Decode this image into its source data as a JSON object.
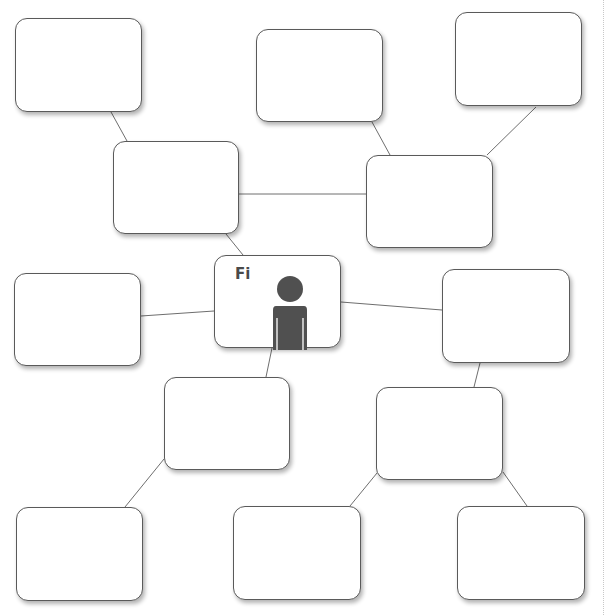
{
  "page": {
    "top_text_clipped": "",
    "background": "#ffffff"
  },
  "diagram": {
    "type": "mind-map",
    "stroke_color": "#5a5a5a",
    "line_color": "#6e6e6e",
    "center": {
      "label": "Fi",
      "icon": "person-icon",
      "icon_color": "#505050",
      "box": {
        "x": 214,
        "y": 255,
        "w": 127,
        "h": 93
      }
    },
    "nodes": [
      {
        "id": "n1",
        "text": "",
        "box": {
          "x": 15,
          "y": 18,
          "w": 127,
          "h": 94
        }
      },
      {
        "id": "n2",
        "text": "",
        "box": {
          "x": 113,
          "y": 141,
          "w": 126,
          "h": 93
        }
      },
      {
        "id": "n3",
        "text": "",
        "box": {
          "x": 256,
          "y": 29,
          "w": 127,
          "h": 93
        }
      },
      {
        "id": "n4",
        "text": "",
        "box": {
          "x": 455,
          "y": 12,
          "w": 127,
          "h": 94
        }
      },
      {
        "id": "n5",
        "text": "",
        "box": {
          "x": 366,
          "y": 155,
          "w": 127,
          "h": 93
        }
      },
      {
        "id": "n6",
        "text": "",
        "box": {
          "x": 14,
          "y": 273,
          "w": 127,
          "h": 93
        }
      },
      {
        "id": "n7",
        "text": "",
        "box": {
          "x": 442,
          "y": 269,
          "w": 128,
          "h": 94
        }
      },
      {
        "id": "n8",
        "text": "",
        "box": {
          "x": 164,
          "y": 377,
          "w": 126,
          "h": 93
        }
      },
      {
        "id": "n9",
        "text": "",
        "box": {
          "x": 376,
          "y": 387,
          "w": 127,
          "h": 93
        }
      },
      {
        "id": "n10",
        "text": "",
        "box": {
          "x": 16,
          "y": 507,
          "w": 127,
          "h": 94
        }
      },
      {
        "id": "n11",
        "text": "",
        "box": {
          "x": 233,
          "y": 506,
          "w": 128,
          "h": 94
        }
      },
      {
        "id": "n12",
        "text": "",
        "box": {
          "x": 457,
          "y": 506,
          "w": 128,
          "h": 94
        }
      }
    ],
    "links": [
      {
        "from": "n1",
        "to": "n2",
        "x1": 111,
        "y1": 112,
        "x2": 127,
        "y2": 141
      },
      {
        "from": "n2",
        "to": "n5",
        "x1": 239,
        "y1": 194,
        "x2": 366,
        "y2": 194
      },
      {
        "from": "n2",
        "to": "center",
        "x1": 226,
        "y1": 234,
        "x2": 243,
        "y2": 255
      },
      {
        "from": "n3",
        "to": "n5",
        "x1": 372,
        "y1": 122,
        "x2": 390,
        "y2": 155
      },
      {
        "from": "n4",
        "to": "n5",
        "x1": 536,
        "y1": 107,
        "x2": 487,
        "y2": 155
      },
      {
        "from": "n6",
        "to": "center",
        "x1": 141,
        "y1": 316,
        "x2": 214,
        "y2": 311
      },
      {
        "from": "center",
        "to": "n7",
        "x1": 341,
        "y1": 302,
        "x2": 442,
        "y2": 310
      },
      {
        "from": "center",
        "to": "n8",
        "x1": 272,
        "y1": 348,
        "x2": 266,
        "y2": 377
      },
      {
        "from": "n7",
        "to": "n9",
        "x1": 480,
        "y1": 363,
        "x2": 474,
        "y2": 387
      },
      {
        "from": "n8",
        "to": "n10",
        "x1": 164,
        "y1": 459,
        "x2": 125,
        "y2": 507
      },
      {
        "from": "n9",
        "to": "n11",
        "x1": 377,
        "y1": 473,
        "x2": 350,
        "y2": 506
      },
      {
        "from": "n9",
        "to": "n12",
        "x1": 503,
        "y1": 472,
        "x2": 527,
        "y2": 506
      }
    ]
  }
}
